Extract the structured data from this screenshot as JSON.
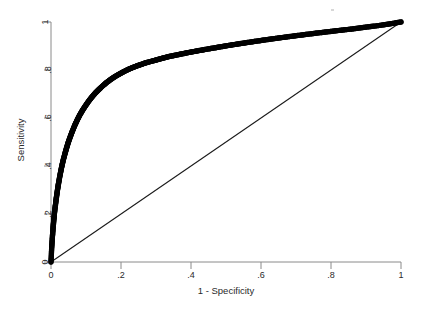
{
  "figure": {
    "background_color": "#ffffff",
    "axis_color": "#4a4a4a",
    "curve_color": "#000000",
    "reference_line_color": "#1a1a1a",
    "text_color": "#2a2a2a"
  },
  "chart_data": {
    "type": "line",
    "title": "",
    "subtitle": "",
    "xlabel": "1 - Specificity",
    "ylabel": "Sensitivity",
    "xlim": [
      0,
      1
    ],
    "ylim": [
      0,
      1
    ],
    "grid": false,
    "legend": null,
    "legend_position": "none",
    "xticks": [
      0,
      0.2,
      0.4,
      0.6,
      0.8,
      1
    ],
    "xtick_labels": [
      "0",
      ".2",
      ".4",
      ".6",
      ".8",
      "1"
    ],
    "yticks": [
      0,
      0.2,
      0.4,
      0.6,
      0.8,
      1
    ],
    "ytick_labels": [
      "0",
      ".2",
      ".4",
      ".6",
      ".8",
      "1"
    ],
    "series": [
      {
        "name": "ROC curve",
        "style": "thick-marker-line",
        "color": "#000000",
        "x": [
          0.0,
          0.002,
          0.004,
          0.006,
          0.008,
          0.01,
          0.013,
          0.016,
          0.019,
          0.022,
          0.026,
          0.03,
          0.034,
          0.039,
          0.044,
          0.049,
          0.055,
          0.061,
          0.068,
          0.075,
          0.082,
          0.09,
          0.098,
          0.107,
          0.116,
          0.126,
          0.136,
          0.147,
          0.158,
          0.17,
          0.182,
          0.195,
          0.209,
          0.223,
          0.238,
          0.253,
          0.269,
          0.286,
          0.303,
          0.321,
          0.34,
          0.36,
          0.38,
          0.401,
          0.423,
          0.446,
          0.47,
          0.494,
          0.519,
          0.545,
          0.572,
          0.6,
          0.629,
          0.659,
          0.69,
          0.722,
          0.755,
          0.789,
          0.824,
          0.86,
          0.897,
          0.935,
          0.967,
          1.0
        ],
        "y": [
          0.0,
          0.06,
          0.105,
          0.143,
          0.176,
          0.206,
          0.242,
          0.275,
          0.305,
          0.332,
          0.364,
          0.393,
          0.419,
          0.447,
          0.473,
          0.497,
          0.522,
          0.545,
          0.57,
          0.592,
          0.612,
          0.632,
          0.65,
          0.669,
          0.686,
          0.703,
          0.718,
          0.733,
          0.747,
          0.76,
          0.772,
          0.783,
          0.794,
          0.804,
          0.813,
          0.821,
          0.829,
          0.836,
          0.843,
          0.85,
          0.857,
          0.863,
          0.869,
          0.875,
          0.881,
          0.887,
          0.893,
          0.899,
          0.905,
          0.911,
          0.917,
          0.923,
          0.929,
          0.935,
          0.941,
          0.947,
          0.953,
          0.959,
          0.965,
          0.971,
          0.978,
          0.985,
          0.992,
          1.0
        ]
      },
      {
        "name": "Reference line",
        "style": "thin-line",
        "color": "#1a1a1a",
        "x": [
          0,
          1
        ],
        "y": [
          0,
          1
        ]
      }
    ]
  }
}
